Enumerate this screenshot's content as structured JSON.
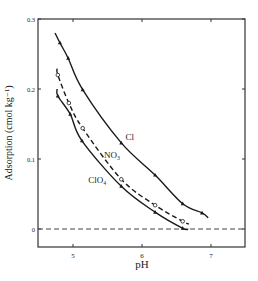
{
  "chart_data": {
    "type": "line",
    "title": "",
    "xlabel": "pH",
    "ylabel": "Adsorption (cmol kg⁻¹)",
    "xlim": [
      4.47,
      7.48
    ],
    "ylim": [
      -0.026,
      0.3
    ],
    "xticks": [
      5,
      6,
      7
    ],
    "xtick_labels": [
      "5",
      "6",
      "7"
    ],
    "yticks": [
      0,
      0.1,
      0.2,
      0.3
    ],
    "ytick_labels": [
      "0",
      "0.1",
      "0.2",
      "0.3"
    ],
    "grid": false,
    "legend": "inline labels",
    "reference_line": {
      "y": 0,
      "style": "dashed"
    },
    "series": [
      {
        "name": "Cl",
        "label": "Cl",
        "style": "solid",
        "marker": "triangle",
        "x": [
          4.74,
          4.81,
          4.93,
          5.14,
          5.7,
          6.19,
          6.59,
          6.87,
          6.96
        ],
        "y": [
          0.28,
          0.266,
          0.244,
          0.199,
          0.123,
          0.077,
          0.036,
          0.023,
          0.016
        ],
        "label_pos": [
          5.76,
          0.127
        ]
      },
      {
        "name": "NO3",
        "label": "NO₃",
        "style": "dashed",
        "marker": "circle",
        "x": [
          4.77,
          4.78,
          4.94,
          5.14,
          5.7,
          6.19,
          6.59,
          6.68
        ],
        "y": [
          0.229,
          0.22,
          0.18,
          0.144,
          0.071,
          0.034,
          0.011,
          0.007
        ],
        "label_pos": [
          5.45,
          0.101
        ]
      },
      {
        "name": "ClO4",
        "label": "ClO₄",
        "style": "solid",
        "marker": "triangle",
        "x": [
          4.77,
          4.78,
          4.96,
          5.13,
          5.7,
          6.19,
          6.59,
          6.67
        ],
        "y": [
          0.2,
          0.19,
          0.164,
          0.126,
          0.061,
          0.024,
          0.001,
          0.0
        ],
        "label_pos": [
          5.22,
          0.066
        ]
      }
    ]
  },
  "labels": {
    "xlabel": "pH",
    "ylabel": "Adsorption (cmol kg⁻¹)"
  }
}
